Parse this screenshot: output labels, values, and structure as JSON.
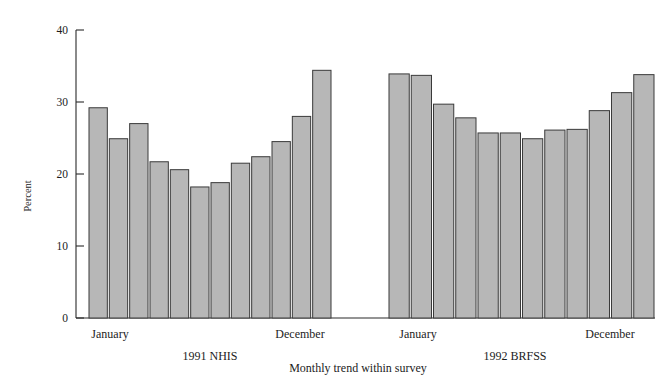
{
  "chart_data": {
    "type": "bar",
    "title": "",
    "subtitle": "",
    "xlabel": "Monthly trend within survey",
    "ylabel": "Percent",
    "ylim": [
      0,
      40
    ],
    "yticks": [
      0,
      10,
      20,
      30,
      40
    ],
    "ytick_labels": [
      "0",
      "10",
      "20",
      "30",
      "40"
    ],
    "grid": false,
    "legend": "none",
    "groups": [
      {
        "name": "1991 NHIS",
        "first_label": "January",
        "last_label": "December",
        "categories": [
          "January",
          "February",
          "March",
          "April",
          "May",
          "June",
          "July",
          "August",
          "September",
          "October",
          "November",
          "December"
        ],
        "values": [
          29.2,
          24.9,
          27.0,
          21.7,
          20.6,
          18.2,
          18.8,
          21.5,
          22.4,
          24.5,
          28.0,
          34.4
        ]
      },
      {
        "name": "1992 BRFSS",
        "first_label": "January",
        "last_label": "December",
        "categories": [
          "January",
          "February",
          "March",
          "April",
          "May",
          "June",
          "July",
          "August",
          "September",
          "October",
          "November",
          "December"
        ],
        "values": [
          33.9,
          33.7,
          29.7,
          27.8,
          25.7,
          25.7,
          24.9,
          26.1,
          26.2,
          28.8,
          31.3,
          33.8
        ]
      }
    ]
  },
  "axis": {
    "y_title": "Percent",
    "x_title": "Monthly trend within survey",
    "tick_0": "0",
    "tick_10": "10",
    "tick_20": "20",
    "tick_30": "30",
    "tick_40": "40"
  },
  "labels": {
    "group1_start": "January",
    "group1_end": "December",
    "group1_name": "1991 NHIS",
    "group2_start": "January",
    "group2_end": "December",
    "group2_name": "1992 BRFSS"
  },
  "colors": {
    "bar_fill": "#b7b7b7",
    "bar_stroke": "#3a3a3a",
    "axis": "#2a2a2a",
    "text": "#1c1c1c",
    "background": "#ffffff"
  }
}
